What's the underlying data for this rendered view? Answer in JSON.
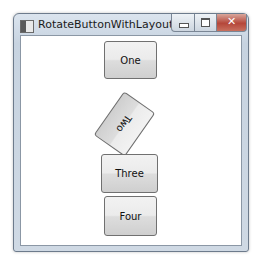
{
  "window": {
    "title": "RotateButtonWithLayout",
    "controls": {
      "minimize": "minimize",
      "maximize": "maximize",
      "close": "✕"
    }
  },
  "buttons": [
    {
      "label": "One",
      "rotation_deg": 0
    },
    {
      "label": "Two",
      "rotation_deg": 125
    },
    {
      "label": "Three",
      "rotation_deg": 0
    },
    {
      "label": "Four",
      "rotation_deg": 0
    }
  ],
  "colors": {
    "close_button": "#b5473a",
    "frame": "#c7d3e0",
    "client_bg": "#ffffff"
  }
}
